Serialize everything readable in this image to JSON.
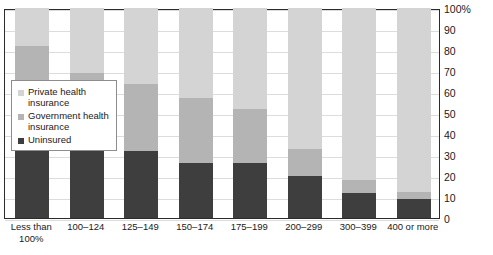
{
  "chart_data": {
    "type": "bar",
    "subtype": "stacked-bar-100-percent",
    "title": "",
    "xlabel": "",
    "ylabel": "",
    "ylim": [
      0,
      100
    ],
    "yticks": [
      "0",
      "10",
      "20",
      "30",
      "40",
      "50",
      "60",
      "70",
      "80",
      "90",
      "100%"
    ],
    "grid": true,
    "legend_position": "inside-left",
    "categories": [
      "Less than 100%",
      "100–124",
      "125–149",
      "150–174",
      "175–199",
      "200–299",
      "300–399",
      "400 or more"
    ],
    "series": [
      {
        "name": "Uninsured",
        "color": "#3e3e3e",
        "values": [
          32,
          32,
          32,
          26,
          26,
          20,
          12,
          9
        ]
      },
      {
        "name": "Government health insurance",
        "color": "#b4b4b4",
        "values": [
          50,
          37,
          32,
          31,
          26,
          13,
          6,
          3.5
        ]
      },
      {
        "name": "Private health insurance",
        "color": "#d4d4d4",
        "values": [
          18,
          31,
          36,
          43,
          48,
          67,
          82,
          87.5
        ]
      }
    ]
  },
  "legend": {
    "items": [
      {
        "label": "Private health insurance",
        "color": "#d4d4d4",
        "swatch": "private-swatch"
      },
      {
        "label": "Government health insurance",
        "color": "#b4b4b4",
        "swatch": "government-swatch"
      },
      {
        "label": "Uninsured",
        "color": "#3e3e3e",
        "swatch": "uninsured-swatch"
      }
    ]
  }
}
